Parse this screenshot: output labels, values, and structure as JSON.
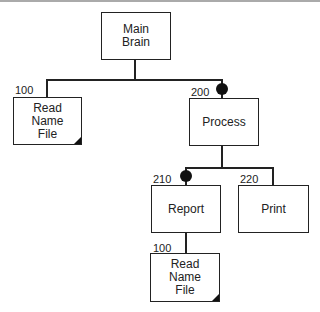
{
  "diagram": {
    "type": "structure-chart",
    "nodes": {
      "main": {
        "label_line1": "Main",
        "label_line2": "Brain"
      },
      "read1": {
        "number": "100",
        "label_line1": "Read",
        "label_line2": "Name",
        "label_line3": "File"
      },
      "process": {
        "number": "200",
        "label": "Process"
      },
      "report": {
        "number": "210",
        "label": "Report"
      },
      "print": {
        "number": "220",
        "label": "Print"
      },
      "read2": {
        "number": "100",
        "label_line1": "Read",
        "label_line2": "Name",
        "label_line3": "File"
      }
    },
    "edges": [
      {
        "from": "main",
        "to": "read1"
      },
      {
        "from": "main",
        "to": "process",
        "marker": "filled-circle"
      },
      {
        "from": "process",
        "to": "report",
        "marker": "filled-circle"
      },
      {
        "from": "process",
        "to": "print"
      },
      {
        "from": "report",
        "to": "read2"
      }
    ],
    "colors": {
      "line": "#222222",
      "background": "#ffffff"
    }
  }
}
